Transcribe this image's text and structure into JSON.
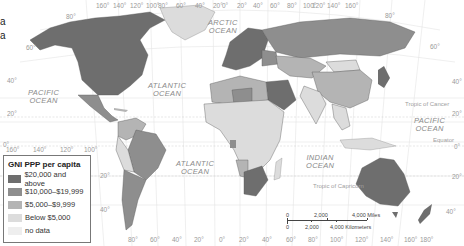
{
  "title_fragment": [
    "a",
    "a"
  ],
  "legend": {
    "title": "GNI PPP per capita",
    "items": [
      {
        "label": "$20,000 and above",
        "color": "#6e6e6e"
      },
      {
        "label": "$10,000–$19,999",
        "color": "#8e8e8e"
      },
      {
        "label": "$5,000–$9,999",
        "color": "#b4b4b4"
      },
      {
        "label": "Below $5,000",
        "color": "#dcdcdc"
      },
      {
        "label": "no data",
        "color": "#eeeeee"
      }
    ]
  },
  "oceans": {
    "arctic": "ARCTIC\nOCEAN",
    "atlantic_north": "ATLANTIC\nOCEAN",
    "atlantic_south": "ATLANTIC\nOCEAN",
    "pacific_west": "PACIFIC\nOCEAN",
    "pacific_east": "PACIFIC\nOCEAN",
    "indian": "INDIAN\nOCEAN"
  },
  "lines": {
    "tropic_cancer": "Tropic of Cancer",
    "equator": "Equator",
    "tropic_capricorn": "Tropic of Capricorn"
  },
  "longitude_top": [
    "160°",
    "140°",
    "120°",
    "100°",
    "80°",
    "60°",
    "40°",
    "20°",
    "0°",
    "20°",
    "40°",
    "60°",
    "80°",
    "100°",
    "120°",
    "140°",
    "160°",
    "180°"
  ],
  "longitude_left_bottom": [
    "160°",
    "140°",
    "120°",
    "100°"
  ],
  "longitude_bottom": [
    "80°",
    "60°",
    "40°",
    "20°",
    "0°",
    "20°",
    "40°",
    "60°",
    "80°",
    "100°",
    "120°",
    "140°",
    "160°",
    "180°"
  ],
  "latitude_left": [
    "80°",
    "60°",
    "40°",
    "20°",
    "0°"
  ],
  "latitude_right": [
    "80°",
    "60°",
    "40°",
    "20°",
    "0°",
    "20°",
    "40°"
  ],
  "latitude_sa": [
    "20°",
    "40°"
  ],
  "scale": {
    "miles": [
      "0",
      "2,000",
      "4,000 Miles"
    ],
    "km": [
      "0",
      "2,000",
      "4,000 Kilometers"
    ]
  },
  "colors": {
    "high": "#6e6e6e",
    "upper_mid": "#8e8e8e",
    "lower_mid": "#b4b4b4",
    "low": "#dcdcdc",
    "no_data": "#eeeeee",
    "grid": "#e2e2e2",
    "border": "#555555"
  }
}
